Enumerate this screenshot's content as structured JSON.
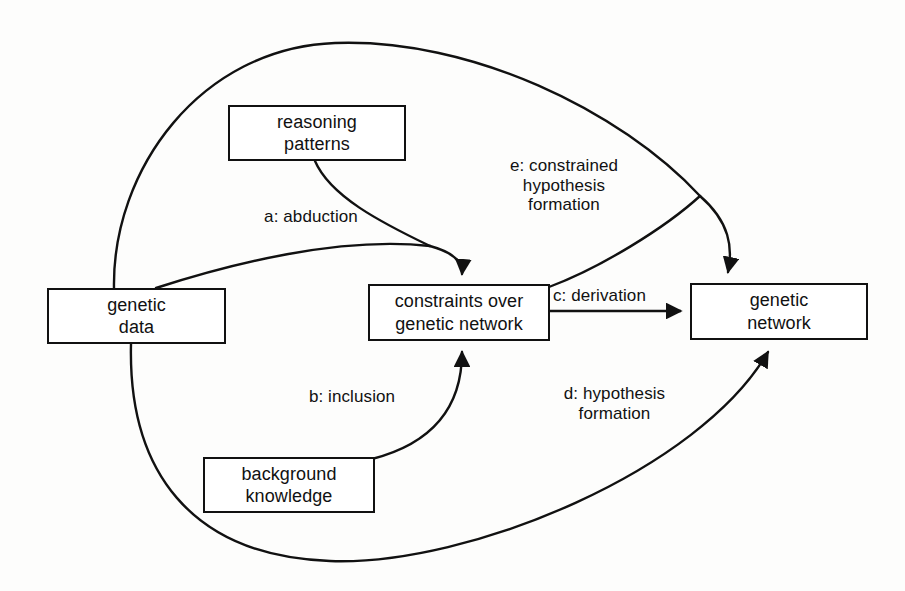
{
  "diagram": {
    "stroke_color": "#111111",
    "background_color": "#fdfdfc",
    "nodes": [
      {
        "id": "reasoning-patterns",
        "lines": [
          "reasoning",
          "patterns"
        ]
      },
      {
        "id": "genetic-data",
        "lines": [
          "genetic",
          "data"
        ]
      },
      {
        "id": "constraints-over-genetic-network",
        "lines": [
          "constraints over",
          "genetic network"
        ]
      },
      {
        "id": "genetic-network",
        "lines": [
          "genetic",
          "network"
        ]
      },
      {
        "id": "background-knowledge",
        "lines": [
          "background",
          "knowledge"
        ]
      }
    ],
    "edges": [
      {
        "id": "a",
        "label_lines": [
          "a: abduction"
        ],
        "from": "reasoning-patterns / genetic-data",
        "to": "constraints-over-genetic-network"
      },
      {
        "id": "b",
        "label_lines": [
          "b: inclusion"
        ],
        "from": "background-knowledge",
        "to": "constraints-over-genetic-network"
      },
      {
        "id": "c",
        "label_lines": [
          "c: derivation"
        ],
        "from": "constraints-over-genetic-network",
        "to": "genetic-network"
      },
      {
        "id": "d",
        "label_lines": [
          "d: hypothesis",
          "formation"
        ],
        "from": "genetic-data",
        "to": "genetic-network"
      },
      {
        "id": "e",
        "label_lines": [
          "e: constrained",
          "hypothesis",
          "formation"
        ],
        "from": "genetic-data / constraints-over-genetic-network",
        "to": "genetic-network"
      }
    ]
  }
}
